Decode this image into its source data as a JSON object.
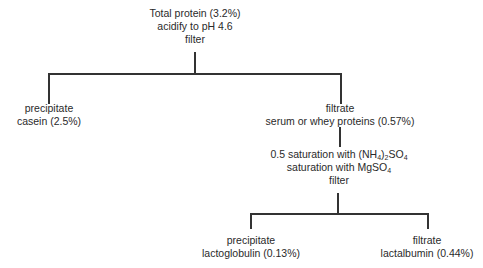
{
  "diagram": {
    "root": {
      "lines": [
        "Total protein (3.2%)",
        "acidify to pH 4.6",
        "filter"
      ]
    },
    "casein": {
      "lines": [
        "precipitate",
        "casein (2.5%)"
      ]
    },
    "whey": {
      "lines": [
        "filtrate",
        "serum or whey proteins (0.57%)"
      ]
    },
    "step2": {
      "line1_prefix": "0.5 saturation with (NH",
      "line1_sub1": "4",
      "line1_mid": ")",
      "line1_sub2": "2",
      "line1_suffix": "SO",
      "line1_sub3": "4",
      "line2_prefix": "saturation with MgSO",
      "line2_sub": "4",
      "line3": "filter"
    },
    "lactoglobulin": {
      "lines": [
        "precipitate",
        "lactoglobulin (0.13%)"
      ]
    },
    "lactalbumin": {
      "lines": [
        "filtrate",
        "lactalbumin (0.44%)"
      ]
    },
    "line_color": "#333333"
  }
}
